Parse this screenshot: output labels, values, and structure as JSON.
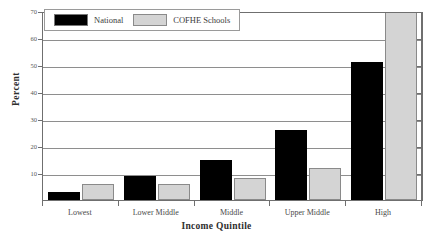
{
  "chart_data": {
    "type": "bar",
    "title": "",
    "xlabel": "Income Quintile",
    "ylabel": "Percent",
    "categories": [
      "Lowest",
      "Lower Middle",
      "Middle",
      "Upper Middle",
      "High"
    ],
    "series": [
      {
        "name": "National",
        "color": "#000000",
        "values": [
          3,
          9,
          15,
          26,
          51
        ]
      },
      {
        "name": "COFHE Schools",
        "color": "#d4d4d4",
        "values": [
          6,
          6,
          8,
          12,
          74
        ]
      }
    ],
    "ylim": [
      0,
      70
    ],
    "yticks": [
      10,
      20,
      30,
      40,
      50,
      60,
      70
    ],
    "ytick_labels": [
      "10",
      "20",
      "30",
      "40",
      "50",
      "60",
      "70"
    ],
    "grid": true,
    "legend_position": "top-left"
  },
  "legend": {
    "entries": [
      {
        "label": "National",
        "swatch": "black-swatch"
      },
      {
        "label": "COFHE Schools",
        "swatch": "gray-swatch"
      }
    ]
  },
  "axes": {
    "y_title": "Percent",
    "x_title": "Income Quintile"
  }
}
